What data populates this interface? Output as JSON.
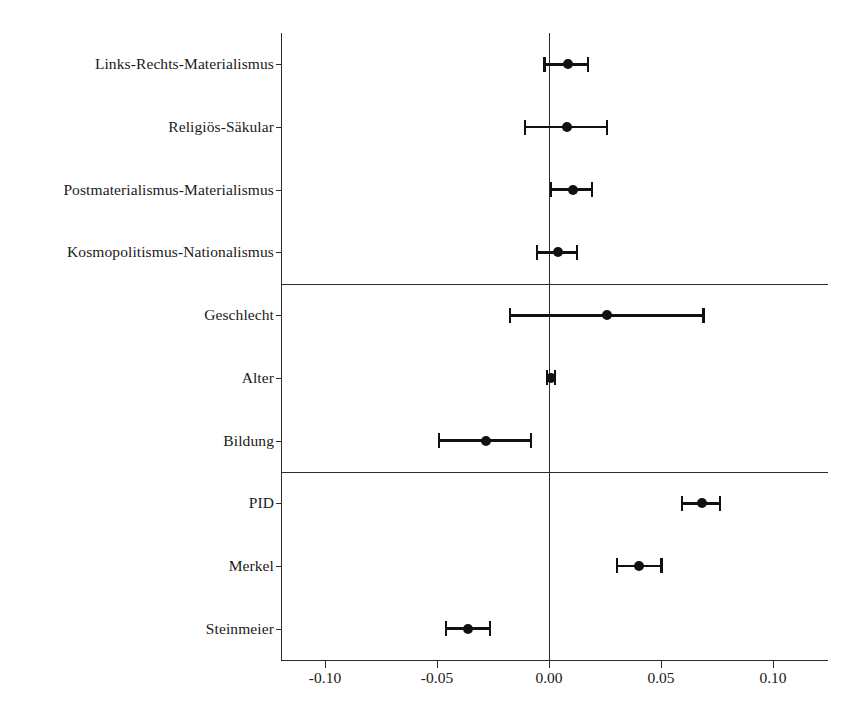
{
  "chart_data": {
    "type": "scatter",
    "subtype": "coefficient-forest-plot",
    "title": "",
    "xlabel": "",
    "ylabel": "",
    "xlim": [
      -0.12,
      0.125
    ],
    "xticks": [
      -0.1,
      -0.05,
      0.0,
      0.05,
      0.1
    ],
    "xticklabels": [
      "-0.10",
      "-0.05",
      "0.00",
      "0.05",
      "0.10"
    ],
    "grid": false,
    "legend": "none",
    "reference_line": 0.0,
    "group_separators": [
      4,
      7
    ],
    "groups": [
      {
        "name": "Einstellungsdimensionen",
        "rows": [
          0,
          1,
          2,
          3
        ]
      },
      {
        "name": "Soziodemografie",
        "rows": [
          4,
          5,
          6
        ]
      },
      {
        "name": "Politische Prädispositionen",
        "rows": [
          7,
          8,
          9
        ]
      }
    ],
    "categories": [
      "Links-Rechts-Materialismus",
      "Religiös-Säkular",
      "Postmaterialismus-Materialismus",
      "Kosmopolitismus-Nationalismus",
      "Geschlecht",
      "Alter",
      "Bildung",
      "PID",
      "Merkel",
      "Steinmeier"
    ],
    "points": [
      {
        "label": "Links-Rechts-Materialismus",
        "estimate": 0.0085,
        "ci_low": -0.002,
        "ci_high": 0.0174
      },
      {
        "label": "Religiös-Säkular",
        "estimate": 0.008,
        "ci_low": -0.0107,
        "ci_high": 0.0259
      },
      {
        "label": "Postmaterialismus-Materialismus",
        "estimate": 0.0107,
        "ci_low": 0.0009,
        "ci_high": 0.0192
      },
      {
        "label": "Kosmopolitismus-Nationalismus",
        "estimate": 0.004,
        "ci_low": -0.0054,
        "ci_high": 0.0125
      },
      {
        "label": "Geschlecht",
        "estimate": 0.0259,
        "ci_low": -0.0174,
        "ci_high": 0.0688
      },
      {
        "label": "Alter",
        "estimate": 0.0009,
        "ci_low": -0.0009,
        "ci_high": 0.0027
      },
      {
        "label": "Bildung",
        "estimate": -0.0281,
        "ci_low": -0.0491,
        "ci_high": -0.008
      },
      {
        "label": "PID",
        "estimate": 0.0683,
        "ci_low": 0.0594,
        "ci_high": 0.0763
      },
      {
        "label": "Merkel",
        "estimate": 0.0402,
        "ci_low": 0.0304,
        "ci_high": 0.0504
      },
      {
        "label": "Steinmeier",
        "estimate": -0.0362,
        "ci_low": -0.046,
        "ci_high": -0.0263
      }
    ],
    "colors": {
      "marker": "#111111",
      "axis": "#2b2b2b",
      "background": "#ffffff"
    }
  }
}
